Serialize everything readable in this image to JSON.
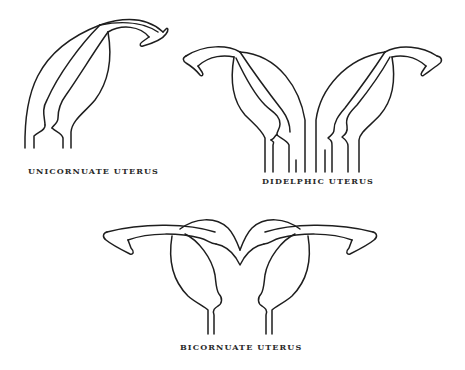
{
  "figure": {
    "diagrams": [
      {
        "id": "unicornuate",
        "label": "UNICORNUATE UTERUS"
      },
      {
        "id": "didelphic",
        "label": "DIDELPHIC UTERUS"
      },
      {
        "id": "bicornuate",
        "label": "BICORNUATE UTERUS"
      }
    ],
    "colors": {
      "stroke": "#1e1e1e",
      "text": "#2a2a2a",
      "background": "#ffffff"
    }
  }
}
